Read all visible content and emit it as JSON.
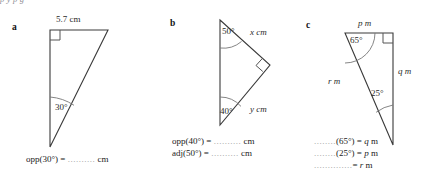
{
  "page": {
    "clipped_header_fragment": "p y                    p                                                                                                          g",
    "background": "#ffffff",
    "ink": "#333333"
  },
  "parts": [
    {
      "id": "a",
      "letter": "a",
      "shape": "right-triangle",
      "labels": {
        "top_side": "5.7 cm",
        "angle": "30°"
      },
      "answers": [
        {
          "prefix": "opp(30°) = ",
          "dots": "..........",
          "unit": "cm"
        }
      ]
    },
    {
      "id": "b",
      "letter": "b",
      "shape": "right-triangle-apex-right",
      "labels": {
        "upper_angle": "50°",
        "lower_angle": "40°",
        "upper_side": "x cm",
        "lower_side": "y cm"
      },
      "answers": [
        {
          "prefix": "opp(40°) = ",
          "dots": "..........",
          "unit": "cm"
        },
        {
          "prefix": "adj(50°) = ",
          "dots": "..........",
          "unit": "cm"
        }
      ]
    },
    {
      "id": "c",
      "letter": "c",
      "shape": "right-triangle",
      "labels": {
        "top_side": "p m",
        "right_side": "q m",
        "hyp_side": "r m",
        "upper_angle": "65°",
        "lower_angle": "25°"
      },
      "answers": [
        {
          "dots": "........",
          "prefix": "(65°) = ",
          "value": "q",
          "unit": "m"
        },
        {
          "dots": "........",
          "prefix": "(25°) = ",
          "value": "p",
          "unit": "m"
        },
        {
          "dots": "..............",
          "prefix": "= ",
          "value": "r",
          "unit": "m"
        }
      ]
    }
  ]
}
